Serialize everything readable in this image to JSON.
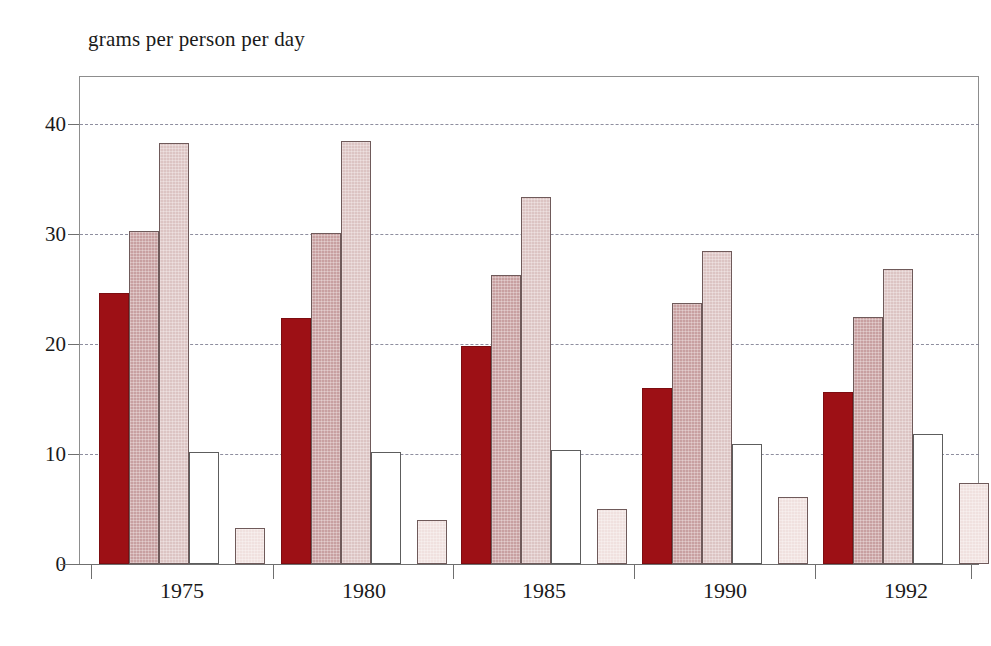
{
  "chart_data": {
    "type": "bar",
    "title": "grams per person per day",
    "xlabel": "",
    "ylabel": "grams per person per day",
    "categories": [
      "1975",
      "1980",
      "1985",
      "1990",
      "1992"
    ],
    "ylim": [
      0,
      44
    ],
    "yticks": [
      0,
      10,
      20,
      30,
      40
    ],
    "ytick_labels": [
      "0",
      "10",
      "20",
      "30",
      "40"
    ],
    "grid": true,
    "grid_axis": "y",
    "grid_style": "dashed",
    "legend": "none",
    "series": [
      {
        "name": "series-1",
        "color": "#9d1015",
        "values": [
          24.6,
          22.4,
          19.8,
          16.0,
          15.6
        ]
      },
      {
        "name": "series-2",
        "color": "#c8a0a1",
        "values": [
          30.3,
          30.1,
          26.3,
          23.7,
          22.5
        ]
      },
      {
        "name": "series-3",
        "color": "#dcc4c3",
        "values": [
          38.3,
          38.5,
          33.4,
          28.5,
          26.8
        ]
      },
      {
        "name": "series-4",
        "color": "#ffffff",
        "values": [
          10.2,
          10.2,
          10.4,
          10.9,
          11.8
        ]
      },
      {
        "name": "series-5",
        "color": "#f0e1df",
        "values": [
          3.3,
          4.0,
          5.0,
          6.1,
          7.4
        ]
      }
    ]
  },
  "axis": {
    "title": "grams per person per day"
  }
}
